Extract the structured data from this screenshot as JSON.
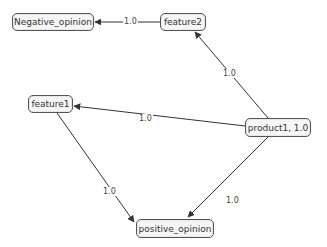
{
  "diagram": {
    "nodes": [
      {
        "id": "negative_opinion",
        "label": "Negative_opinion"
      },
      {
        "id": "feature2",
        "label": "feature2"
      },
      {
        "id": "feature1",
        "label": "feature1"
      },
      {
        "id": "product1",
        "label": "product1, 1.0"
      },
      {
        "id": "positive_opinion",
        "label": "positive_opinion"
      }
    ],
    "edges": [
      {
        "from": "feature2",
        "to": "negative_opinion",
        "label": "1.0"
      },
      {
        "from": "product1",
        "to": "feature2",
        "label": "1.0"
      },
      {
        "from": "product1",
        "to": "feature1",
        "label": "1.0"
      },
      {
        "from": "feature1",
        "to": "positive_opinion",
        "label": "1.0"
      },
      {
        "from": "product1",
        "to": "positive_opinion",
        "label": "1.0"
      }
    ],
    "colors": {
      "edge": "#333333",
      "node_border": "#555555",
      "node_fill": "#f6f6f6"
    }
  }
}
